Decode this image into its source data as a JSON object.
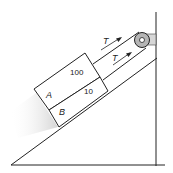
{
  "diagram": {
    "blocks": {
      "A": {
        "label": "A",
        "mass_label": "100"
      },
      "B": {
        "label": "B",
        "mass_label": "10"
      }
    },
    "tension_labels": {
      "upper": "T",
      "lower": "T"
    },
    "colors": {
      "line": "#222222",
      "shadow": "#d8d8d8",
      "pulley": "#bbbbbb",
      "background": "#ffffff"
    }
  }
}
